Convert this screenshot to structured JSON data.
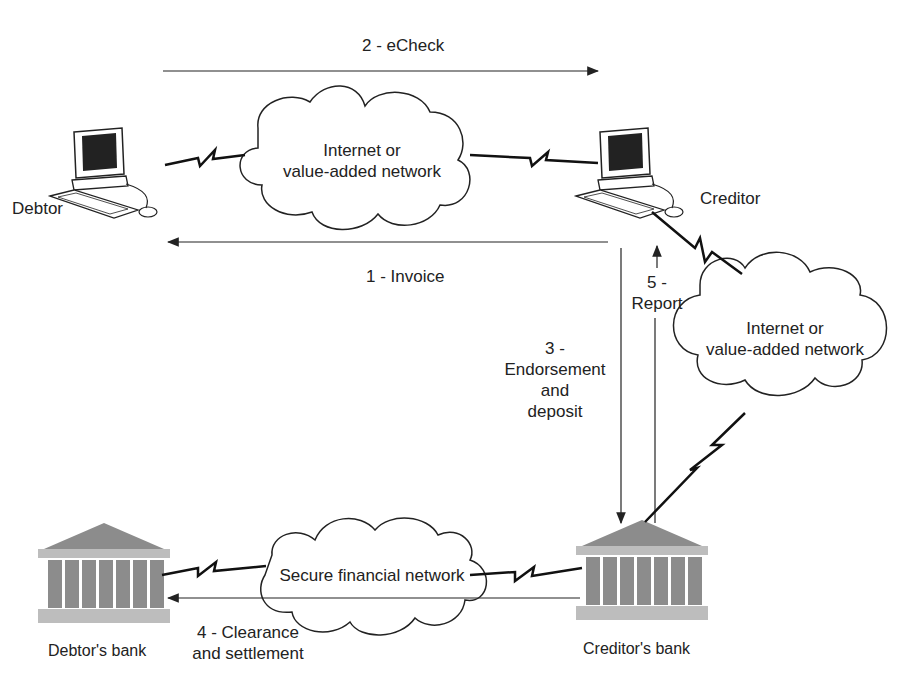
{
  "diagram": {
    "type": "eCheck payment flow",
    "nodes": {
      "debtor": {
        "label": "Debtor",
        "icon": "computer-icon"
      },
      "creditor": {
        "label": "Creditor",
        "icon": "computer-icon"
      },
      "debtors_bank": {
        "label": "Debtor's bank",
        "icon": "bank-icon"
      },
      "creditors_bank": {
        "label": "Creditor's bank",
        "icon": "bank-icon"
      }
    },
    "clouds": {
      "top": {
        "line1": "Internet or",
        "line2": "value-added network"
      },
      "right": {
        "line1": "Internet or",
        "line2": "value-added network"
      },
      "bottom": {
        "line1": "Secure financial network"
      }
    },
    "steps": {
      "s1": {
        "label": "1 - Invoice"
      },
      "s2": {
        "label": "2 - eCheck"
      },
      "s3": {
        "line1": "3 -",
        "line2": "Endorsement",
        "line3": "and",
        "line4": "deposit"
      },
      "s4": {
        "line1": "4 - Clearance",
        "line2": "and settlement"
      },
      "s5": {
        "line1": "5 -",
        "line2": "Report"
      }
    },
    "colors": {
      "line": "#222222",
      "bank": "#8c8c8c",
      "bank_light": "#bdbdbd"
    }
  }
}
